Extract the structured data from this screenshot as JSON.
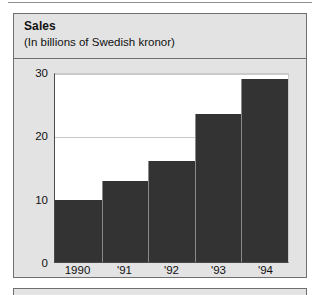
{
  "panel": {
    "title": "Sales",
    "subtitle": "(In billions of Swedish kronor)"
  },
  "colors": {
    "bar": "#333333",
    "panel_background": "#e3e3e3",
    "plot_background": "#ffffff",
    "gridline": "#c9c9c9",
    "border": "#6f6f6f"
  },
  "chart_data": {
    "type": "bar",
    "title": "Sales",
    "subtitle": "(In billions of Swedish kronor)",
    "categories": [
      "1990",
      "'91",
      "'92",
      "'93",
      "'94"
    ],
    "values": [
      9.8,
      12.8,
      16.0,
      23.3,
      28.9
    ],
    "xlabel": "",
    "ylabel": "",
    "ylim": [
      0,
      30
    ],
    "yticks": [
      0,
      10,
      20,
      30
    ],
    "ytick_labels": [
      "0",
      "10",
      "20",
      "30"
    ],
    "grid": true,
    "legend": false,
    "bar_color": "#333333"
  }
}
